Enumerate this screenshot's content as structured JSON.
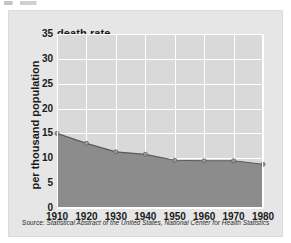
{
  "chart_data": {
    "type": "area",
    "title": "death rate",
    "xlabel": "",
    "ylabel": "per thousand population",
    "categories": [
      1910,
      1920,
      1930,
      1940,
      1950,
      1960,
      1970,
      1980
    ],
    "values": [
      15.0,
      13.0,
      11.3,
      10.8,
      9.6,
      9.5,
      9.5,
      8.8
    ],
    "x_tick_labels": [
      "1910",
      "1920",
      "1930",
      "1940",
      "1950",
      "1960",
      "1970",
      "1980"
    ],
    "y_tick_labels": [
      "0",
      "5",
      "10",
      "15",
      "20",
      "25",
      "30",
      "35"
    ],
    "y_ticks": [
      0,
      5,
      10,
      15,
      20,
      25,
      30,
      35
    ],
    "xlim": [
      1910,
      1980
    ],
    "ylim": [
      0,
      35
    ],
    "grid": true,
    "legend": "none",
    "series": [
      {
        "name": "death rate",
        "values": [
          15.0,
          13.0,
          11.3,
          10.8,
          9.6,
          9.5,
          9.5,
          8.8
        ]
      }
    ],
    "colors": {
      "plot_background": "#d9d9d9",
      "panel_background": "#e6e6e6",
      "grid": "#ffffff",
      "area_fill": "#8c8c8c",
      "line": "#5a5a5a",
      "marker": "#9a9a9a",
      "text": "#1a1a1a"
    }
  },
  "source": {
    "label": "Source:",
    "text": " Statistical Abstract of the United States, National Center for Health Statistics"
  }
}
